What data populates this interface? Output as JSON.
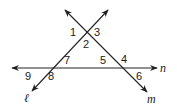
{
  "diagram": {
    "lines": [
      {
        "name": "n",
        "label": "n"
      },
      {
        "name": "l",
        "label": "ℓ"
      },
      {
        "name": "m",
        "label": "m"
      }
    ],
    "angle_labels": {
      "a1": "1",
      "a2": "2",
      "a3": "3",
      "a4": "4",
      "a5": "5",
      "a6": "6",
      "a7": "7",
      "a8": "8",
      "a9": "9"
    },
    "colors": {
      "line": "#222222",
      "background": "#ffffff"
    }
  }
}
